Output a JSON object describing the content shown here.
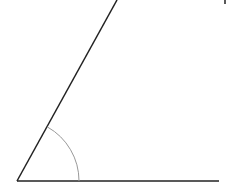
{
  "diagram": {
    "type": "angle",
    "colors": {
      "line": "#222222",
      "arc": "#999999",
      "background": "#ffffff"
    },
    "vertex": [
      17,
      181
    ],
    "base_ray_end": [
      219,
      181
    ],
    "upper_ray_end": [
      117,
      0
    ],
    "arc": {
      "radius": 62,
      "start": [
        79,
        181
      ],
      "end": [
        48,
        126
      ]
    },
    "corner_mark": [
      225,
      0,
      225,
      4
    ]
  }
}
